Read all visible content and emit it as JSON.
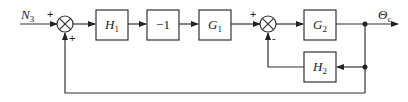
{
  "diagram": {
    "type": "block-diagram",
    "input": {
      "label": "N",
      "sub": "3"
    },
    "output": {
      "label": "Θ",
      "sub": "c"
    },
    "blocks": [
      {
        "id": "H1",
        "label": "H",
        "sub": "1"
      },
      {
        "id": "neg1",
        "label": "−1",
        "sub": ""
      },
      {
        "id": "G1",
        "label": "G",
        "sub": "1"
      },
      {
        "id": "G2",
        "label": "G",
        "sub": "2"
      },
      {
        "id": "H2",
        "label": "H",
        "sub": "2"
      }
    ],
    "junctions": [
      {
        "id": "sum1",
        "signs": {
          "left": "+",
          "bottom": "+"
        }
      },
      {
        "id": "sum2",
        "signs": {
          "left": "+",
          "bottom": "−"
        }
      }
    ],
    "signs": {
      "sum1_left": "+",
      "sum1_bottom": "+",
      "sum2_left": "+",
      "sum2_bottom": "-"
    }
  }
}
